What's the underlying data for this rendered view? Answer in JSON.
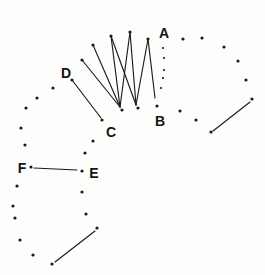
{
  "figure": {
    "background_color": "#fdfdfc",
    "ink_color": "#1b1b1b",
    "canvas": {
      "width": 265,
      "height": 275
    },
    "labels": [
      {
        "id": "A",
        "text": "A",
        "x": 164,
        "y": 33
      },
      {
        "id": "B",
        "text": "B",
        "x": 160,
        "y": 121
      },
      {
        "id": "C",
        "text": "C",
        "x": 111,
        "y": 132
      },
      {
        "id": "D",
        "text": "D",
        "x": 66,
        "y": 73
      },
      {
        "id": "E",
        "text": "E",
        "x": 94,
        "y": 173
      },
      {
        "id": "F",
        "text": "F",
        "x": 22,
        "y": 168
      }
    ],
    "outer_arc_dots": [
      [
        52,
        264
      ],
      [
        33,
        255
      ],
      [
        20,
        240
      ],
      [
        15,
        218
      ],
      [
        13,
        206
      ],
      [
        17,
        186
      ],
      [
        31,
        167
      ],
      [
        25,
        145
      ],
      [
        21,
        128
      ],
      [
        26,
        108
      ],
      [
        37,
        98
      ],
      [
        53,
        88
      ],
      [
        72,
        80
      ],
      [
        82,
        60
      ],
      [
        93,
        45
      ],
      [
        111,
        36
      ],
      [
        130,
        32
      ],
      [
        148,
        39
      ],
      [
        183,
        39
      ],
      [
        202,
        38
      ],
      [
        224,
        47
      ],
      [
        238,
        61
      ],
      [
        246,
        80
      ],
      [
        252,
        99
      ]
    ],
    "inner_arc_dots": [
      [
        157,
        106
      ],
      [
        138,
        108
      ],
      [
        122,
        110
      ],
      [
        102,
        120
      ],
      [
        93,
        141
      ],
      [
        85,
        153
      ],
      [
        82,
        171
      ],
      [
        82,
        192
      ],
      [
        86,
        214
      ],
      [
        97,
        228
      ],
      [
        180,
        111
      ],
      [
        196,
        120
      ],
      [
        211,
        132
      ]
    ],
    "small_column_dots": [
      [
        163,
        48
      ],
      [
        164,
        58
      ],
      [
        164,
        70
      ],
      [
        163,
        78
      ],
      [
        161,
        88
      ]
    ],
    "zigzag_lines": [
      [
        72,
        80,
        101,
        118
      ],
      [
        82,
        60,
        120,
        107
      ],
      [
        93,
        45,
        120,
        107
      ],
      [
        111,
        36,
        120,
        107
      ],
      [
        130,
        32,
        120,
        107
      ],
      [
        111,
        36,
        136,
        105
      ],
      [
        130,
        32,
        136,
        105
      ],
      [
        148,
        39,
        136,
        105
      ],
      [
        148,
        39,
        155,
        98
      ]
    ],
    "segment_lines": [
      [
        34,
        168,
        77,
        170
      ],
      [
        213,
        131,
        250,
        102
      ],
      [
        55,
        262,
        95,
        231
      ]
    ],
    "dot_radius": 1.6,
    "small_dot_radius": 1.1,
    "line_width": 1.15
  }
}
